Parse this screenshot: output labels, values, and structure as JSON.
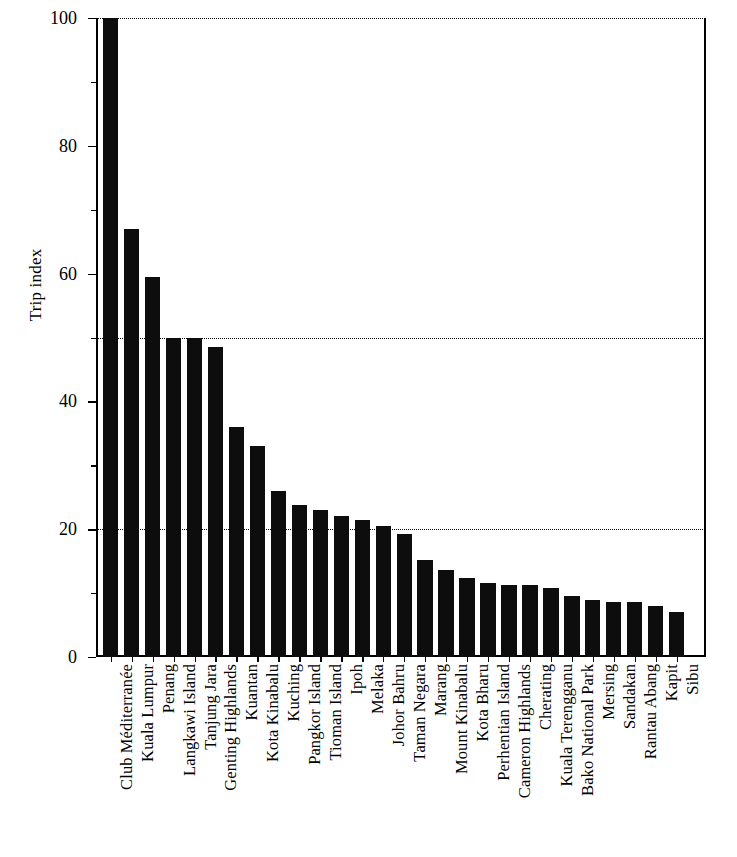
{
  "chart_data": {
    "type": "bar",
    "title": "",
    "subtitle": "",
    "xlabel": "",
    "ylabel": "Trip index",
    "ylim": [
      0,
      100
    ],
    "yticks": [
      0,
      20,
      40,
      60,
      80,
      100
    ],
    "yticklabels": [
      "0",
      "20",
      "40",
      "60",
      "80",
      "100"
    ],
    "minor_yticks": [
      10,
      30,
      50,
      70,
      90
    ],
    "gridlines": [
      20,
      50,
      100
    ],
    "grid": "horizontal-dotted",
    "legend": null,
    "bar_color": "#0d0d0d",
    "orientation": "vertical",
    "categories": [
      "Club Méditerranée",
      "Kuala Lumpur",
      "Penang",
      "Langkawi Island",
      "Tanjung Jara",
      "Genting Highlands",
      "Kuantan",
      "Kota Kinabalu",
      "Kuching",
      "Pangkor Island",
      "Tioman Island",
      "Ipoh",
      "Melaka",
      "Johor Bahru",
      "Taman Negara",
      "Marang",
      "Mount Kinabalu",
      "Kota Bharu",
      "Perhentian Island",
      "Cameron Highlands",
      "Cherating",
      "Kuala Terengganu",
      "Bako National Park",
      "Mersing",
      "Sandakan",
      "Rantau Abang",
      "Kapit",
      "Sibu"
    ],
    "values": [
      100,
      67,
      59.5,
      50,
      50,
      48.5,
      36,
      33,
      26,
      23.8,
      23,
      22,
      21.5,
      20.5,
      19.3,
      15.2,
      13.6,
      12.3,
      11.6,
      11.2,
      11.2,
      10.8,
      9.6,
      9,
      8.6,
      8.6,
      8,
      7
    ]
  },
  "axis": {
    "y_title": "Trip index"
  }
}
